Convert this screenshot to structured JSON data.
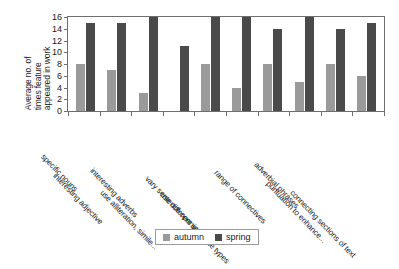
{
  "chart_data": {
    "type": "bar",
    "title": "",
    "xlabel": "",
    "ylabel": "Average no. of times feature appeared in work",
    "ylabel_lines": [
      "Average no. of",
      "times feature",
      "appeared in work"
    ],
    "ylim": [
      0,
      16
    ],
    "yticks": [
      0,
      2,
      4,
      6,
      8,
      10,
      12,
      14,
      16
    ],
    "grid": false,
    "legend_position": "bottom",
    "categories": [
      "specific nouns",
      "interesting adjective",
      "interesting adverbs",
      "use alliteration, simile...",
      "vary sentence openings",
      "use different sentence types",
      "range of connectives",
      "adverbial phrases",
      "puntuation to enhance...",
      "connecting sections of text"
    ],
    "series": [
      {
        "name": "autumn",
        "color": "#9a9a9a",
        "values": [
          8,
          7,
          3,
          0,
          8,
          4,
          8,
          5,
          8,
          6
        ]
      },
      {
        "name": "spring",
        "color": "#4a4a4a",
        "values": [
          15,
          15,
          16,
          11,
          16,
          16,
          14,
          16,
          14,
          15
        ]
      }
    ]
  }
}
